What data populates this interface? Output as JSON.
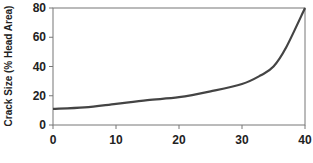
{
  "chart_data": {
    "type": "line",
    "title": "",
    "xlabel": "",
    "ylabel": "Crack Size (% Head Area)",
    "xlim": [
      0,
      40
    ],
    "ylim": [
      0,
      80
    ],
    "x_ticks": [
      "0",
      "10",
      "20",
      "30",
      "40"
    ],
    "y_ticks": [
      "0",
      "20",
      "40",
      "60",
      "80"
    ],
    "grid": false,
    "legend": null,
    "series": [
      {
        "name": "Crack Size",
        "color": "#444444",
        "x": [
          0,
          5,
          10,
          15,
          20,
          25,
          30,
          33,
          35,
          37,
          40
        ],
        "y": [
          11,
          12,
          14.5,
          17,
          19,
          23,
          28,
          34,
          40,
          53,
          80
        ]
      }
    ]
  }
}
